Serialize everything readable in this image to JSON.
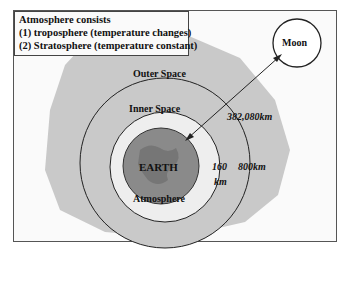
{
  "legend": {
    "title": "Atmosphere consists",
    "line1": "(1) troposphere (temperature changes)",
    "line2": "(2) Stratosphere (temperature constant)"
  },
  "labels": {
    "moon": "Moon",
    "outer_space": "Outer Space",
    "inner_space": "Inner Space",
    "earth": "EARTH",
    "atmosphere": "Atmosphere",
    "distance_moon": "382,080km",
    "distance_inner": "160",
    "distance_inner_unit": "km",
    "distance_outer": "800km"
  },
  "colors": {
    "outer_space_fill": "#c9c9c9",
    "inner_space_fill": "#c9c9c9",
    "atmosphere_fill": "#eeeeee",
    "earth_fill": "#8a8a8a",
    "line": "#222222"
  }
}
